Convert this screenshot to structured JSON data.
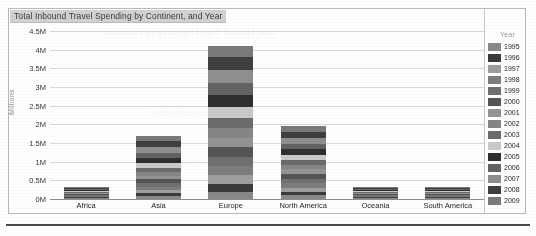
{
  "chart_data": {
    "type": "bar",
    "subtype": "stacked-bar",
    "title": "Total Inbound Travel Spending by Continent, and Year",
    "xlabel": "",
    "ylabel": "Millions",
    "categories": [
      "Africa",
      "Asia",
      "Europe",
      "North America",
      "Oceania",
      "South America"
    ],
    "ylim": [
      0,
      4500000
    ],
    "ytick_labels": [
      "0M",
      "0.5M",
      "1M",
      "1.5M",
      "2M",
      "2.5M",
      "3M",
      "3.5M",
      "4M",
      "4.5M"
    ],
    "ytick_values": [
      0,
      500000,
      1000000,
      1500000,
      2000000,
      2500000,
      3000000,
      3500000,
      4000000,
      4500000
    ],
    "grid": true,
    "legend_position": "right",
    "legend_title": "Year",
    "totals": [
      220000,
      1680000,
      4100000,
      1950000,
      190000,
      100000
    ],
    "series": [
      {
        "name": "1995",
        "color": "#8a8a8a",
        "values": [
          9000,
          72000,
          196000,
          96000,
          8000,
          4000
        ]
      },
      {
        "name": "1996",
        "color": "#3b3b3b",
        "values": [
          10000,
          78000,
          212000,
          102000,
          8500,
          4300
        ]
      },
      {
        "name": "1997",
        "color": "#9e9e9e",
        "values": [
          11000,
          84000,
          226000,
          108000,
          9000,
          4600
        ]
      },
      {
        "name": "1998",
        "color": "#7d7d7d",
        "values": [
          12000,
          90000,
          238000,
          114000,
          9500,
          5000
        ]
      },
      {
        "name": "1999",
        "color": "#707070",
        "values": [
          13000,
          97000,
          250000,
          120000,
          10500,
          5400
        ]
      },
      {
        "name": "2000",
        "color": "#555555",
        "values": [
          14000,
          104000,
          264000,
          128000,
          11500,
          5900
        ]
      },
      {
        "name": "2001",
        "color": "#949494",
        "values": [
          14500,
          101000,
          258000,
          124000,
          11000,
          5700
        ]
      },
      {
        "name": "2002",
        "color": "#868686",
        "values": [
          15500,
          106000,
          266000,
          126000,
          12000,
          6000
        ]
      },
      {
        "name": "2003",
        "color": "#6b6b6b",
        "values": [
          16500,
          112000,
          272000,
          128000,
          13000,
          6400
        ]
      },
      {
        "name": "2004",
        "color": "#c9c9c9",
        "values": [
          18000,
          122000,
          292000,
          138000,
          14500,
          7200
        ]
      },
      {
        "name": "2005",
        "color": "#2f2f2f",
        "values": [
          19000,
          130000,
          306000,
          145000,
          15500,
          7800
        ]
      },
      {
        "name": "2006",
        "color": "#636363",
        "values": [
          20500,
          140000,
          322000,
          152000,
          16500,
          8400
        ]
      },
      {
        "name": "2007",
        "color": "#8f8f8f",
        "values": [
          22000,
          152000,
          344000,
          160000,
          18000,
          9200
        ]
      },
      {
        "name": "2008",
        "color": "#3f3f3f",
        "values": [
          23000,
          162000,
          360000,
          166000,
          19500,
          9900
        ]
      },
      {
        "name": "2009",
        "color": "#7a7a7a",
        "values": [
          22000,
          130000,
          294000,
          143000,
          13000,
          10200
        ]
      }
    ]
  },
  "scan_artifacts": {
    "bleed_top": "Total Inbound Travel Spending by Continent",
    "bleed_mid": "continent spending chart",
    "bleed_low": "travel year data"
  }
}
